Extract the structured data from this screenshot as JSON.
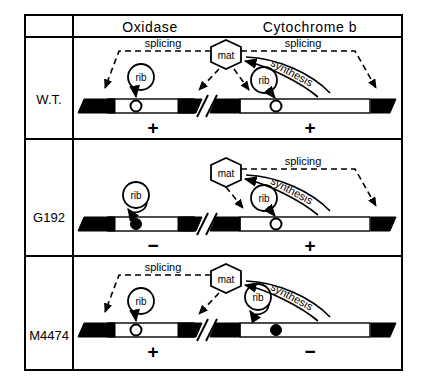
{
  "figure": {
    "title_row": {
      "left_header": "Oxidase",
      "right_header": "Cytochrome  b"
    },
    "labels": {
      "splicing": "splicing",
      "synthesis": "synthesis",
      "mat": "mat",
      "rib": "rib",
      "plus": "+",
      "minus": "−"
    },
    "rows": [
      {
        "name": "W.T.",
        "oxidase": {
          "sign": "+",
          "marker": "open",
          "splicing_label": "splicing",
          "has_splicing_arrow": true,
          "rib_label": "rib",
          "rib_mode": "arrow-to-marker"
        },
        "cytochrome_b": {
          "sign": "+",
          "marker": "open",
          "splicing_label": "splicing",
          "has_splicing_arrow": true,
          "rib_label": "rib",
          "rib_mode": "arrow-to-marker",
          "synthesis_label": "synthesis"
        },
        "mat_label": "mat"
      },
      {
        "name": "G192",
        "oxidase": {
          "sign": "−",
          "marker": "filled",
          "splicing_label": "",
          "has_splicing_arrow": false,
          "rib_label": "rib",
          "rib_mode": "self-loop"
        },
        "cytochrome_b": {
          "sign": "+",
          "marker": "open",
          "splicing_label": "splicing",
          "has_splicing_arrow": true,
          "rib_label": "rib",
          "rib_mode": "arrow-to-marker",
          "synthesis_label": "synthesis"
        },
        "mat_label": "mat"
      },
      {
        "name": "M4474",
        "oxidase": {
          "sign": "+",
          "marker": "open",
          "splicing_label": "splicing",
          "has_splicing_arrow": true,
          "rib_label": "rib",
          "rib_mode": "arrow-to-marker"
        },
        "cytochrome_b": {
          "sign": "−",
          "marker": "filled",
          "splicing_label": "",
          "has_splicing_arrow": false,
          "rib_label": "rib",
          "rib_mode": "self-loop",
          "synthesis_label": "synthesis"
        },
        "mat_label": "mat"
      }
    ],
    "colors": {
      "ink": "#000000",
      "paper": "#ffffff"
    }
  }
}
